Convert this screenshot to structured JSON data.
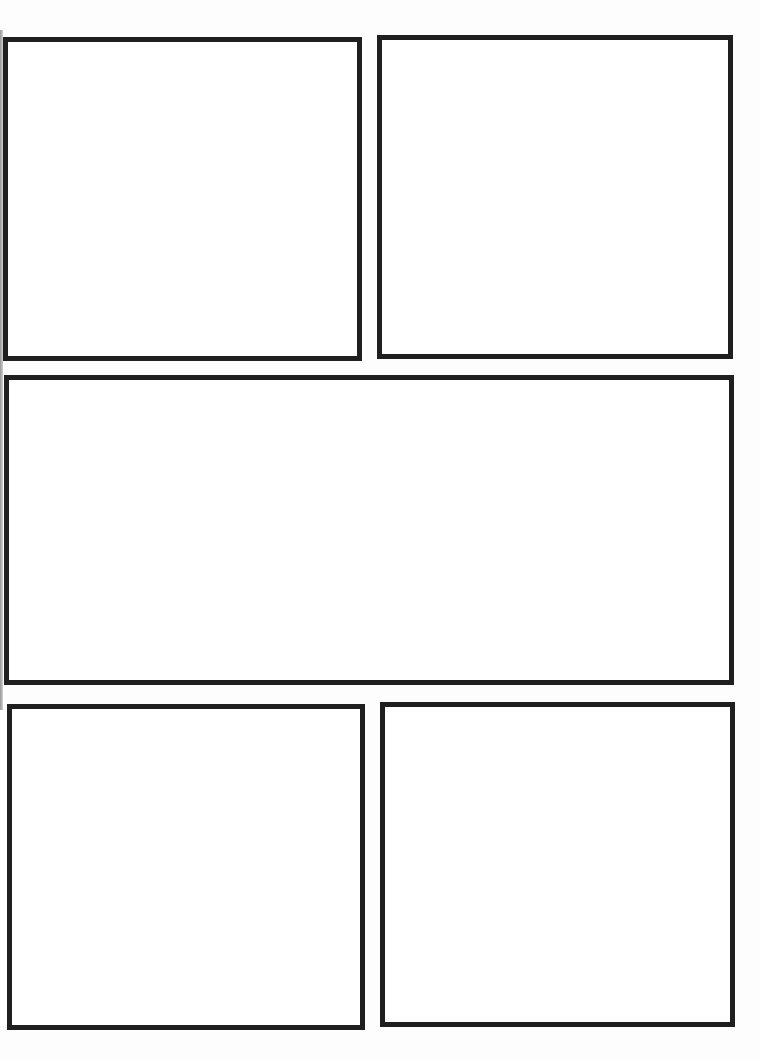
{
  "page": {
    "type": "blank comic page template",
    "background_color": "#fdfdfd",
    "panel_border_color": "#1f1f1f",
    "panel_fill_color": "#ffffff"
  },
  "panels": [
    {
      "id": "panel-1",
      "row": 1,
      "position": "top-left",
      "content": ""
    },
    {
      "id": "panel-2",
      "row": 1,
      "position": "top-right",
      "content": ""
    },
    {
      "id": "panel-3",
      "row": 2,
      "position": "middle-wide",
      "content": ""
    },
    {
      "id": "panel-4",
      "row": 3,
      "position": "bottom-left",
      "content": ""
    },
    {
      "id": "panel-5",
      "row": 3,
      "position": "bottom-right",
      "content": ""
    }
  ]
}
